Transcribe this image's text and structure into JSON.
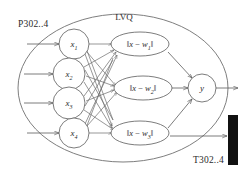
{
  "diagram": {
    "title": "LVQ",
    "left_label": "P302..4",
    "right_label": "T302..4",
    "input_nodes": [
      {
        "name": "x",
        "sub": "1"
      },
      {
        "name": "x",
        "sub": "2"
      },
      {
        "name": "x",
        "sub": "3"
      },
      {
        "name": "x",
        "sub": "4"
      }
    ],
    "hidden_nodes": [
      {
        "prefix": "‖",
        "var": "x",
        "minus": " − ",
        "w": "w",
        "sub": "1",
        "suffix": "‖"
      },
      {
        "prefix": "‖",
        "var": "x",
        "minus": " − ",
        "w": "w",
        "sub": "2",
        "suffix": "‖"
      },
      {
        "prefix": "‖",
        "var": "x",
        "minus": " − ",
        "w": "w",
        "sub": "3",
        "suffix": "‖"
      }
    ],
    "output_node": {
      "name": "y"
    },
    "colors": {
      "line": "#5a5a5a",
      "text": "#2b2b2b",
      "bar": "#111111",
      "background": "#ffffff"
    }
  }
}
